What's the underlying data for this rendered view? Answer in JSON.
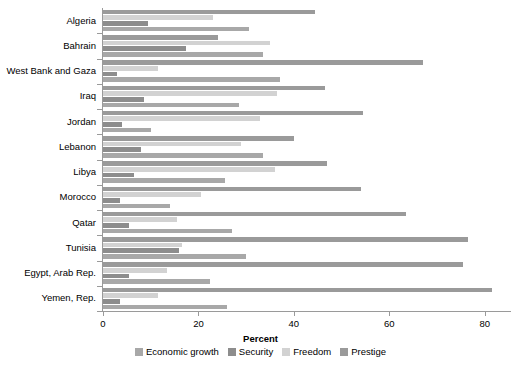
{
  "chart_data": {
    "type": "bar",
    "orientation": "horizontal",
    "title": "",
    "xlabel": "Percent",
    "ylabel": "",
    "xlim": [
      0,
      85.3
    ],
    "xticks": [
      0,
      20,
      40,
      60,
      80
    ],
    "xtick_labels": [
      "0",
      "20",
      "40",
      "60",
      "80"
    ],
    "grid": false,
    "legend_position": "bottom",
    "categories": [
      "Algeria",
      "Bahrain",
      "West Bank and Gaza",
      "Iraq",
      "Jordan",
      "Lebanon",
      "Libya",
      "Morocco",
      "Qatar",
      "Tunisia",
      "Egypt, Arab Rep.",
      "Yemen, Rep."
    ],
    "series": [
      {
        "name": "Economic growth",
        "color": "#a8a8a8",
        "values": [
          30.5,
          33.5,
          37.0,
          28.5,
          10.0,
          33.5,
          25.5,
          14.0,
          27.0,
          30.0,
          22.5,
          26.0
        ]
      },
      {
        "name": "Security",
        "color": "#8d8d8d",
        "values": [
          9.5,
          17.5,
          3.0,
          8.5,
          4.0,
          8.0,
          6.5,
          3.5,
          5.5,
          16.0,
          5.5,
          3.5
        ]
      },
      {
        "name": "Freedom",
        "color": "#d2d2d2",
        "values": [
          23.0,
          35.0,
          11.5,
          36.5,
          33.0,
          29.0,
          36.0,
          20.5,
          15.5,
          16.5,
          13.5,
          11.5
        ]
      },
      {
        "name": "Prestige",
        "color": "#9a9a9a",
        "values": [
          44.5,
          24.0,
          67.0,
          46.5,
          54.5,
          40.0,
          47.0,
          54.0,
          63.5,
          76.5,
          75.5,
          81.5
        ]
      }
    ]
  },
  "legend": {
    "items": [
      {
        "label": "Economic growth",
        "color": "#a8a8a8"
      },
      {
        "label": "Security",
        "color": "#8d8d8d"
      },
      {
        "label": "Freedom",
        "color": "#d2d2d2"
      },
      {
        "label": "Prestige",
        "color": "#9a9a9a"
      }
    ]
  }
}
